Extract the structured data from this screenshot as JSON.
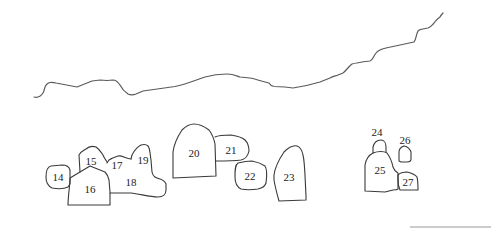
{
  "diagram": {
    "type": "site-plan",
    "ridge_line": "ridge",
    "stones": [
      {
        "id": "14",
        "label": "14"
      },
      {
        "id": "15",
        "label": "15"
      },
      {
        "id": "16",
        "label": "16"
      },
      {
        "id": "17",
        "label": "17"
      },
      {
        "id": "18",
        "label": "18"
      },
      {
        "id": "19",
        "label": "19"
      },
      {
        "id": "20",
        "label": "20"
      },
      {
        "id": "21",
        "label": "21"
      },
      {
        "id": "22",
        "label": "22"
      },
      {
        "id": "23",
        "label": "23"
      },
      {
        "id": "24",
        "label": "24"
      },
      {
        "id": "25",
        "label": "25"
      },
      {
        "id": "26",
        "label": "26"
      },
      {
        "id": "27",
        "label": "27"
      }
    ],
    "colors": {
      "outline": "#3a3a3a",
      "ridge": "#5a5a5a",
      "background": "#ffffff"
    }
  }
}
